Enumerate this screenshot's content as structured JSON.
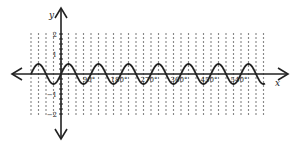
{
  "chart_data": {
    "type": "line",
    "title": "",
    "xlabel": "x",
    "ylabel": "y",
    "x_tick_labels": [
      "90°",
      "180°",
      "270°",
      "360°",
      "450°",
      "540°"
    ],
    "x_ticks_deg": [
      90,
      180,
      270,
      360,
      450,
      540
    ],
    "y_tick_labels": [
      "2",
      "1",
      "−1",
      "−2"
    ],
    "y_ticks": [
      2,
      1,
      -1,
      -2
    ],
    "xlim_deg": [
      -90,
      630
    ],
    "ylim": [
      -2,
      2
    ],
    "grid": "dotted",
    "legend": null,
    "series": [
      {
        "name": "y = 0.5 sin(4x)",
        "function": "0.5*sin(4x)",
        "amplitude": 0.5,
        "period_deg": 90,
        "x_deg_range": [
          -90,
          612
        ]
      }
    ]
  },
  "colors": {
    "background": "#ffffff",
    "axis": "#222222",
    "curve": "#222222",
    "grid_dot": "#444444"
  }
}
